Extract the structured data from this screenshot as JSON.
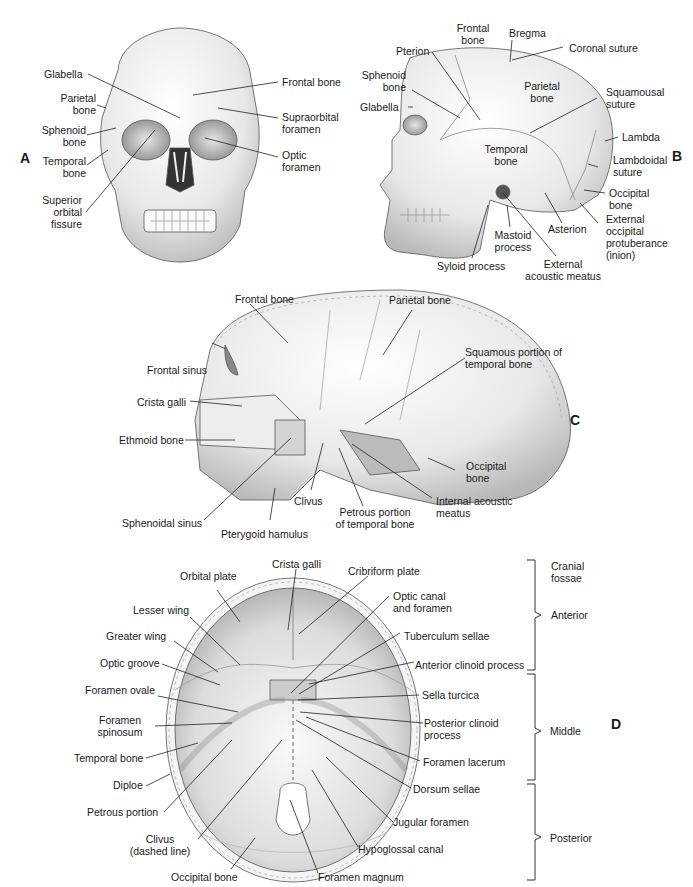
{
  "panels": {
    "A": {
      "letter": "A",
      "view": "anterior view of skull",
      "labels": {
        "glabella": "Glabella",
        "parietal_bone": "Parietal\nbone",
        "sphenoid_bone": "Sphenoid\nbone",
        "temporal_bone": "Temporal\nbone",
        "superior_orbital_fissure": "Superior\norbital\nfissure",
        "frontal_bone": "Frontal bone",
        "supraorbital_foramen": "Supraorbital\nforamen",
        "optic_foramen": "Optic\nforamen"
      }
    },
    "B": {
      "letter": "B",
      "view": "lateral view of skull",
      "labels": {
        "frontal_bone": "Frontal\nbone",
        "bregma": "Bregma",
        "coronal_suture": "Coronal suture",
        "pterion": "Pterion",
        "sphenoid_bone": "Sphenoid\nbone",
        "parietal_bone": "Parietal\nbone",
        "squamousal_suture": "Squamousal\nsuture",
        "glabella": "Glabella",
        "lambda": "Lambda",
        "temporal_bone": "Temporal\nbone",
        "lambdoidal_suture": "Lambdoidal\nsuture",
        "occipital_bone": "Occipital\nbone",
        "asterion": "Asterion",
        "external_occipital_protuberance": "External\noccipital\nprotuberance\n(inion)",
        "mastoid_process": "Mastoid\nprocess",
        "syloid_process": "Syloid process",
        "external_acoustic_meatus": "External\nacoustic meatus"
      }
    },
    "C": {
      "letter": "C",
      "view": "sagittal section of skull",
      "labels": {
        "frontal_bone": "Frontal bone",
        "parietal_bone": "Parietal bone",
        "squamous_portion": "Squamous portion of\ntemporal bone",
        "frontal_sinus": "Frontal sinus",
        "crista_galli": "Crista galli",
        "ethmoid_bone": "Ethmoid bone",
        "occipital_bone": "Occipital\nbone",
        "clivus": "Clivus",
        "internal_acoustic_meatus": "Internal acoustic\nmeatus",
        "sphenoidal_sinus": "Sphenoidal sinus",
        "petrous_portion": "Petrous portion\nof temporal bone",
        "pterygoid_hamulus": "Pterygoid hamulus"
      }
    },
    "D": {
      "letter": "D",
      "view": "cranial floor, superior view",
      "labels_left": {
        "orbital_plate": "Orbital plate",
        "lesser_wing": "Lesser wing",
        "greater_wing": "Greater wing",
        "optic_groove": "Optic groove",
        "foramen_ovale": "Foramen ovale",
        "foramen_spinosum": "Foramen\nspinosum",
        "temporal_bone": "Temporal bone",
        "diploe": "Diploe",
        "petrous_portion": "Petrous portion",
        "clivus": "Clivus\n(dashed line)",
        "occipital_bone": "Occipital bone"
      },
      "labels_right": {
        "crista_galli": "Crista galli",
        "cribriform_plate": "Cribriform plate",
        "optic_canal": "Optic canal\nand foramen",
        "tuberculum_sellae": "Tuberculum sellae",
        "anterior_clinoid": "Anterior clinoid process",
        "sella_turcica": "Sella turcica",
        "posterior_clinoid": "Posterior clinoid\nprocess",
        "foramen_lacerum": "Foramen lacerum",
        "dorsum_sellae": "Dorsum sellae",
        "jugular_foramen": "Jugular foramen",
        "hypoglossal_canal": "Hypoglossal canal",
        "foramen_magnum": "Foramen magnum"
      },
      "fossae": {
        "heading": "Cranial\nfossae",
        "anterior": "Anterior",
        "middle": "Middle",
        "posterior": "Posterior"
      }
    }
  },
  "colors": {
    "bone_light": "#f4f4f4",
    "bone_mid": "#d8d8d8",
    "bone_dark": "#9a9a9a",
    "line": "#222222",
    "text": "#1a1a1a"
  }
}
